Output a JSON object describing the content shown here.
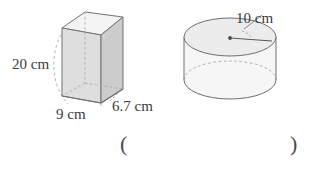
{
  "figure": {
    "background_color": "#ffffff",
    "stroke_color": "#6e6e6e",
    "hidden_stroke_color": "#9a9a9a",
    "text_color": "#3b3b3b",
    "face_fill_front": "#dcdcdc",
    "face_fill_side": "#cfcfcf",
    "face_fill_top": "#f2f2f2",
    "cylinder_fill": "#f4f4f4",
    "cylinder_top_fill": "#ebebeb"
  },
  "prism": {
    "name": "rectangular-prism",
    "height_label": "20 cm",
    "width_label": "9 cm",
    "depth_label": "6.7 cm",
    "height_value": 20,
    "width_value": 9,
    "depth_value": 6.7,
    "units": "cm"
  },
  "cylinder": {
    "name": "cylinder",
    "radius_label": "10 cm",
    "radius_value": 10,
    "units": "cm"
  },
  "answer": {
    "open_paren": "(",
    "close_paren": ")"
  }
}
